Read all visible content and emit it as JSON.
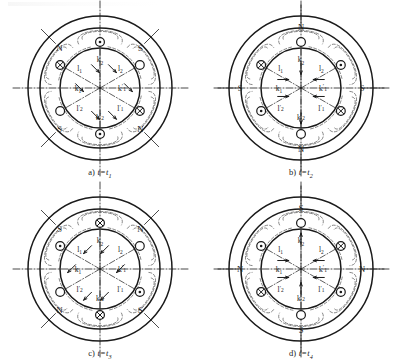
{
  "figure": {
    "background_color": "#ffffff",
    "line_color": "#1a1a1a",
    "dashed_color": "#555555",
    "panel_count": 4,
    "slot_count": 6
  },
  "panels": [
    {
      "id": "a",
      "caption_label": "a)",
      "caption_time": "t=t",
      "caption_index": "1",
      "pole_labels": [
        {
          "text": "N",
          "position": "upper-left"
        },
        {
          "text": "S",
          "position": "upper-right"
        },
        {
          "text": "S",
          "position": "lower-left"
        },
        {
          "text": "N",
          "position": "lower-right"
        }
      ],
      "slots": [
        {
          "name": "slot-top",
          "angle": 270,
          "marker": "dot"
        },
        {
          "name": "slot-upper-right",
          "angle": 330,
          "marker": "circle"
        },
        {
          "name": "slot-lower-right",
          "angle": 30,
          "marker": "cross"
        },
        {
          "name": "slot-bottom",
          "angle": 90,
          "marker": "dot"
        },
        {
          "name": "slot-lower-left",
          "angle": 150,
          "marker": "circle"
        },
        {
          "name": "slot-upper-left",
          "angle": 210,
          "marker": "cross"
        }
      ],
      "winding_labels": [
        {
          "base": "k",
          "sub": "2",
          "prime": false,
          "position": "top"
        },
        {
          "base": "l",
          "sub": "2",
          "prime": false,
          "position": "upper-right"
        },
        {
          "base": "k",
          "sub": "1",
          "prime": true,
          "position": "right"
        },
        {
          "base": "l",
          "sub": "1",
          "prime": true,
          "position": "lower-right"
        },
        {
          "base": "k",
          "sub": "2",
          "prime": true,
          "position": "bottom"
        },
        {
          "base": "l",
          "sub": "2",
          "prime": true,
          "position": "lower-left"
        },
        {
          "base": "k",
          "sub": "1",
          "prime": false,
          "position": "left"
        },
        {
          "base": "l",
          "sub": "1",
          "prime": false,
          "position": "upper-left"
        }
      ],
      "field_axis_degrees": 45
    },
    {
      "id": "b",
      "caption_label": "b)",
      "caption_time": "t=t",
      "caption_index": "2",
      "pole_labels": [
        {
          "text": "N",
          "position": "top"
        },
        {
          "text": "S",
          "position": "left"
        },
        {
          "text": "S",
          "position": "right"
        },
        {
          "text": "N",
          "position": "bottom"
        }
      ],
      "slots": [
        {
          "name": "slot-top",
          "angle": 270,
          "marker": "circle"
        },
        {
          "name": "slot-upper-right",
          "angle": 330,
          "marker": "dot"
        },
        {
          "name": "slot-lower-right",
          "angle": 30,
          "marker": "cross"
        },
        {
          "name": "slot-bottom",
          "angle": 90,
          "marker": "circle"
        },
        {
          "name": "slot-lower-left",
          "angle": 150,
          "marker": "dot"
        },
        {
          "name": "slot-upper-left",
          "angle": 210,
          "marker": "cross"
        }
      ],
      "winding_labels": [
        {
          "base": "k",
          "sub": "2",
          "prime": false,
          "position": "top"
        },
        {
          "base": "l",
          "sub": "2",
          "prime": false,
          "position": "upper-right"
        },
        {
          "base": "k",
          "sub": "1",
          "prime": true,
          "position": "right"
        },
        {
          "base": "l",
          "sub": "1",
          "prime": true,
          "position": "lower-right"
        },
        {
          "base": "k",
          "sub": "2",
          "prime": true,
          "position": "bottom"
        },
        {
          "base": "l",
          "sub": "2",
          "prime": true,
          "position": "lower-left"
        },
        {
          "base": "k",
          "sub": "1",
          "prime": false,
          "position": "left"
        },
        {
          "base": "l",
          "sub": "1",
          "prime": false,
          "position": "upper-left"
        }
      ],
      "field_axis_degrees": 90
    },
    {
      "id": "c",
      "caption_label": "c)",
      "caption_time": "t=t",
      "caption_index": "3",
      "pole_labels": [
        {
          "text": "S",
          "position": "upper-left"
        },
        {
          "text": "N",
          "position": "upper-right"
        },
        {
          "text": "N",
          "position": "lower-left"
        },
        {
          "text": "S",
          "position": "lower-right"
        }
      ],
      "slots": [
        {
          "name": "slot-top",
          "angle": 270,
          "marker": "cross"
        },
        {
          "name": "slot-upper-right",
          "angle": 330,
          "marker": "circle"
        },
        {
          "name": "slot-lower-right",
          "angle": 30,
          "marker": "dot"
        },
        {
          "name": "slot-bottom",
          "angle": 90,
          "marker": "cross"
        },
        {
          "name": "slot-lower-left",
          "angle": 150,
          "marker": "circle"
        },
        {
          "name": "slot-upper-left",
          "angle": 210,
          "marker": "dot"
        }
      ],
      "winding_labels": [
        {
          "base": "k",
          "sub": "2",
          "prime": false,
          "position": "top"
        },
        {
          "base": "l",
          "sub": "2",
          "prime": false,
          "position": "upper-right"
        },
        {
          "base": "k",
          "sub": "1",
          "prime": true,
          "position": "right"
        },
        {
          "base": "l",
          "sub": "1",
          "prime": true,
          "position": "lower-right"
        },
        {
          "base": "k",
          "sub": "2",
          "prime": true,
          "position": "bottom"
        },
        {
          "base": "l",
          "sub": "2",
          "prime": true,
          "position": "lower-left"
        },
        {
          "base": "k",
          "sub": "1",
          "prime": false,
          "position": "left"
        },
        {
          "base": "l",
          "sub": "1",
          "prime": false,
          "position": "upper-left"
        }
      ],
      "field_axis_degrees": 135
    },
    {
      "id": "d",
      "caption_label": "d)",
      "caption_time": "t=t",
      "caption_index": "4",
      "pole_labels": [
        {
          "text": "S",
          "position": "top"
        },
        {
          "text": "N",
          "position": "left"
        },
        {
          "text": "N",
          "position": "right"
        },
        {
          "text": "S",
          "position": "bottom"
        }
      ],
      "slots": [
        {
          "name": "slot-top",
          "angle": 270,
          "marker": "circle"
        },
        {
          "name": "slot-upper-right",
          "angle": 330,
          "marker": "cross"
        },
        {
          "name": "slot-lower-right",
          "angle": 30,
          "marker": "dot"
        },
        {
          "name": "slot-bottom",
          "angle": 90,
          "marker": "circle"
        },
        {
          "name": "slot-lower-left",
          "angle": 150,
          "marker": "cross"
        },
        {
          "name": "slot-upper-left",
          "angle": 210,
          "marker": "dot"
        }
      ],
      "winding_labels": [
        {
          "base": "k",
          "sub": "2",
          "prime": false,
          "position": "top"
        },
        {
          "base": "l",
          "sub": "2",
          "prime": false,
          "position": "upper-right"
        },
        {
          "base": "k",
          "sub": "1",
          "prime": true,
          "position": "right"
        },
        {
          "base": "l",
          "sub": "1",
          "prime": true,
          "position": "lower-right"
        },
        {
          "base": "k",
          "sub": "2",
          "prime": true,
          "position": "bottom"
        },
        {
          "base": "l",
          "sub": "2",
          "prime": true,
          "position": "lower-left"
        },
        {
          "base": "k",
          "sub": "1",
          "prime": false,
          "position": "left"
        },
        {
          "base": "l",
          "sub": "1",
          "prime": false,
          "position": "upper-left"
        }
      ],
      "field_axis_degrees": 180
    }
  ]
}
